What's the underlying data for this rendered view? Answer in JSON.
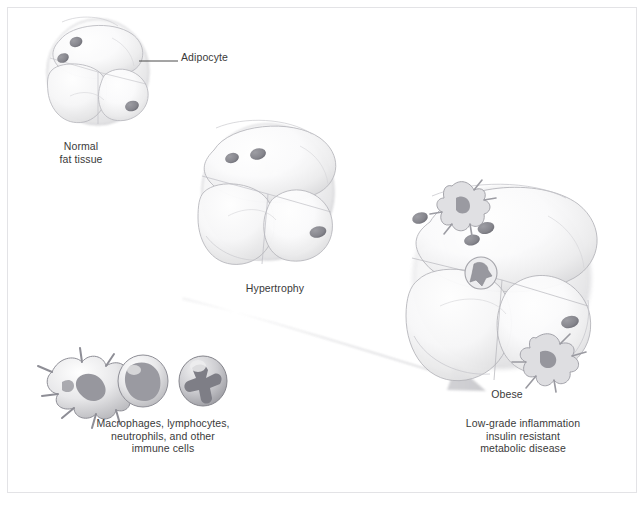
{
  "figure": {
    "type": "scientific-illustration",
    "background_color": "#ffffff",
    "border_color": "#e3e3e6",
    "ink_color": "#3a3a3a"
  },
  "labels": {
    "adipocyte": "Adipocyte",
    "normal_fat_tissue": "Normal\nfat tissue",
    "hypertrophy": "Hypertrophy",
    "obese": "Obese",
    "outcome": "Low-grade inflammation\ninsulin resistant\nmetabolic disease",
    "immune_cells": "Macrophages, lymphocytes,\nneutrophils, and other\nimmune cells"
  },
  "caption": "",
  "stages": [
    {
      "id": "normal",
      "label": "Normal\nfat tissue",
      "cell_count": 4,
      "cluster_radius": 52,
      "center": [
        98,
        70
      ],
      "lipid_droplet_nuclei": 3,
      "macrophages": 0
    },
    {
      "id": "hypertrophy",
      "label": "Hypertrophy",
      "cell_count": 5,
      "cluster_radius": 66,
      "center": [
        268,
        190
      ],
      "lipid_droplet_nuclei": 3,
      "macrophages": 0
    },
    {
      "id": "obese",
      "label": "Obese",
      "cell_count": 7,
      "cluster_radius": 88,
      "center": [
        502,
        278
      ],
      "lipid_droplet_nuclei": 4,
      "macrophages": 3
    }
  ],
  "immune_cell_icons": [
    {
      "name": "macrophage",
      "shape": "spiky-amoeboid"
    },
    {
      "name": "lymphocyte",
      "shape": "round-large-nucleus"
    },
    {
      "name": "neutrophil",
      "shape": "round-multilobed-nucleus"
    }
  ],
  "arrow": {
    "name": "progression-arrow",
    "from": [
      182,
      300
    ],
    "to": [
      483,
      391
    ],
    "color": "#dcdcdf",
    "direction": "left-to-right-descending"
  },
  "leader_line": {
    "name": "adipocyte-leader-line",
    "from": [
      139,
      61
    ],
    "to": [
      178,
      61
    ]
  }
}
